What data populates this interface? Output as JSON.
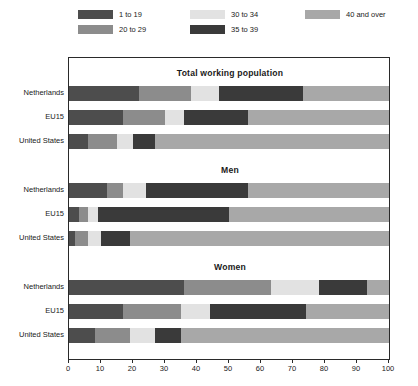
{
  "legend": {
    "items": [
      {
        "label": "1 to 19",
        "color": "#4d4d4d"
      },
      {
        "label": "20 to 29",
        "color": "#8c8c8c"
      },
      {
        "label": "30 to 34",
        "color": "#e2e2e2"
      },
      {
        "label": "35 to 39",
        "color": "#3a3a3a"
      },
      {
        "label": "40 and over",
        "color": "#a8a8a8"
      }
    ]
  },
  "axis": {
    "ticks": [
      "0",
      "10",
      "20",
      "30",
      "40",
      "50",
      "60",
      "70",
      "80",
      "90",
      "100"
    ]
  },
  "panels": [
    {
      "title": "Total working population"
    },
    {
      "title": "Men"
    },
    {
      "title": "Women"
    }
  ],
  "row_labels": [
    "Netherlands",
    "EU15",
    "United States"
  ],
  "chart_data": {
    "type": "bar",
    "orientation": "horizontal",
    "stacked": true,
    "stack_total": 100,
    "title": "",
    "xlabel": "",
    "ylabel": "",
    "xlim": [
      0,
      100
    ],
    "grid": false,
    "legend_position": "top",
    "series": [
      {
        "name": "1 to 19",
        "color": "#4d4d4d"
      },
      {
        "name": "20 to 29",
        "color": "#8c8c8c"
      },
      {
        "name": "30 to 34",
        "color": "#e2e2e2"
      },
      {
        "name": "35 to 39",
        "color": "#3a3a3a"
      },
      {
        "name": "40 and over",
        "color": "#a8a8a8"
      }
    ],
    "panels": [
      {
        "title": "Total working population",
        "categories": [
          "Netherlands",
          "EU15",
          "United States"
        ],
        "values": [
          [
            22,
            16,
            9,
            26,
            27
          ],
          [
            17,
            13,
            6,
            20,
            44
          ],
          [
            6,
            9,
            5,
            7,
            73
          ]
        ]
      },
      {
        "title": "Men",
        "categories": [
          "Netherlands",
          "EU15",
          "United States"
        ],
        "values": [
          [
            12,
            5,
            7,
            32,
            44
          ],
          [
            3,
            3,
            3,
            41,
            50
          ],
          [
            2,
            4,
            4,
            9,
            81
          ]
        ]
      },
      {
        "title": "Women",
        "categories": [
          "Netherlands",
          "EU15",
          "United States"
        ],
        "values": [
          [
            36,
            27,
            15,
            15,
            7
          ],
          [
            17,
            18,
            9,
            30,
            26
          ],
          [
            8,
            11,
            8,
            8,
            65
          ]
        ]
      }
    ]
  }
}
